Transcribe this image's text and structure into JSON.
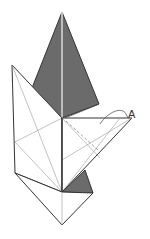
{
  "diagram": {
    "type": "origami-fold-step",
    "labels": [
      {
        "id": "A",
        "text": "A"
      }
    ],
    "colors": {
      "paper_front": "#ffffff",
      "paper_back": "#6b6b6b",
      "outline": "#333333",
      "crease": "#999999"
    }
  }
}
